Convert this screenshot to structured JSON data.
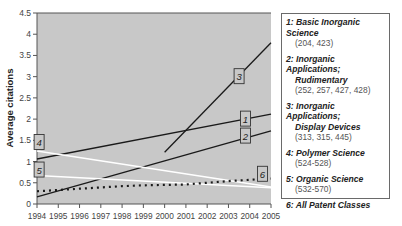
{
  "chart_data": {
    "type": "line",
    "title": "",
    "xlabel": "",
    "ylabel": "Average citations",
    "xlim": [
      1994,
      2005
    ],
    "ylim": [
      0,
      4.5
    ],
    "x_ticks": [
      "1994",
      "1995",
      "1996",
      "1997",
      "1998",
      "1999",
      "2000",
      "2001",
      "2002",
      "2003",
      "2004",
      "2005"
    ],
    "y_ticks": [
      "0",
      "0.5",
      "1",
      "1.5",
      "2",
      "2.5",
      "3",
      "3.5",
      "4",
      "4.5"
    ],
    "grid": false,
    "legend_position": "right",
    "background": "#c8c8c8",
    "series": [
      {
        "id": "1",
        "name": "Basic Inorganic Science",
        "classes": "(204, 423)",
        "style": "solid-black",
        "x": [
          1994,
          2005
        ],
        "y": [
          1.06,
          2.12
        ]
      },
      {
        "id": "2",
        "name": "Inorganic Applications; Rudimentary",
        "classes": "(252, 257, 427, 428)",
        "style": "solid-black",
        "x": [
          1994,
          2005
        ],
        "y": [
          0.17,
          1.72
        ]
      },
      {
        "id": "3",
        "name": "Inorganic Applications; Display Devices",
        "classes": "(313, 315, 445)",
        "style": "solid-black",
        "x": [
          2000,
          2005
        ],
        "y": [
          1.22,
          3.8
        ]
      },
      {
        "id": "4",
        "name": "Polymer Science",
        "classes": "(524-528)",
        "style": "solid-white",
        "x": [
          1994,
          2005
        ],
        "y": [
          1.25,
          0.4
        ]
      },
      {
        "id": "5",
        "name": "Organic Science",
        "classes": "(532-570)",
        "style": "solid-white",
        "x": [
          1994,
          2005
        ],
        "y": [
          0.67,
          0.38
        ]
      },
      {
        "id": "6",
        "name": "All Patent Classes",
        "classes": "",
        "style": "dotted-black",
        "x": [
          1994,
          1995,
          1996,
          1997,
          1998,
          1999,
          2000,
          2001,
          2002,
          2003,
          2004,
          2005
        ],
        "y": [
          0.3,
          0.33,
          0.36,
          0.39,
          0.42,
          0.44,
          0.45,
          0.46,
          0.5,
          0.54,
          0.57,
          0.6
        ]
      }
    ],
    "annotations": [
      {
        "label": "1",
        "x": 2003.8,
        "y": 2.0
      },
      {
        "label": "2",
        "x": 2003.8,
        "y": 1.6
      },
      {
        "label": "3",
        "x": 2003.5,
        "y": 3.0
      },
      {
        "label": "4",
        "x": 1994.1,
        "y": 1.45
      },
      {
        "label": "5",
        "x": 1994.1,
        "y": 0.8
      },
      {
        "label": "6",
        "x": 2004.6,
        "y": 0.7
      }
    ]
  },
  "legend": {
    "entries": [
      {
        "title": "1: Basic Inorganic Science",
        "sub": "(204, 423)"
      },
      {
        "title": "2: Inorganic Applications;",
        "title2": "Rudimentary",
        "sub": "(252, 257, 427, 428)"
      },
      {
        "title": "3: Inorganic Applications;",
        "title2": "Display Devices",
        "sub": "(313, 315, 445)"
      },
      {
        "title": "4: Polymer Science",
        "sub": "(524-528)"
      },
      {
        "title": "5: Organic Science",
        "sub": "(532-570)"
      },
      {
        "title": "6: All Patent Classes"
      }
    ]
  }
}
